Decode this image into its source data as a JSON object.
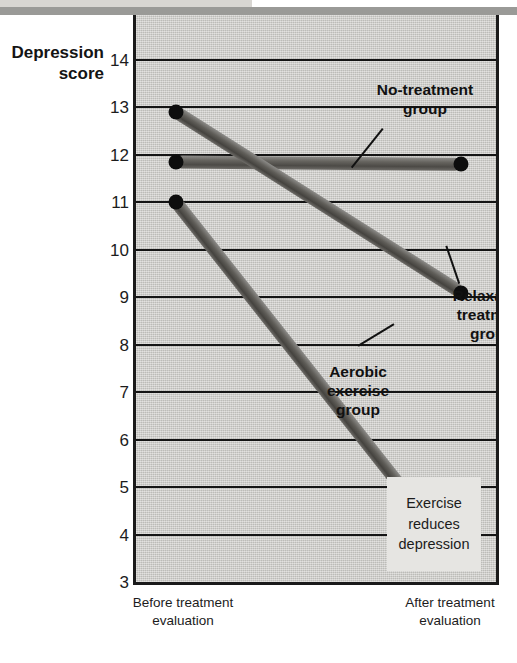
{
  "chart_data": {
    "type": "line",
    "title": "",
    "ylabel_line1": "Depression",
    "ylabel_line2": "score",
    "xlabel": "",
    "categories": [
      "Before treatment evaluation",
      "After treatment evaluation"
    ],
    "x_tick_labels": [
      {
        "line1": "Before treatment",
        "line2": "evaluation"
      },
      {
        "line1": "After treatment",
        "line2": "evaluation"
      }
    ],
    "ylim": [
      3,
      14
    ],
    "y_ticks": [
      14,
      13,
      12,
      11,
      10,
      9,
      8,
      7,
      6,
      5,
      4,
      3
    ],
    "grid": true,
    "legend_position": "inline-callouts",
    "series": [
      {
        "name": "No-treatment group",
        "values": [
          11.85,
          11.8
        ],
        "color": "#5a5853"
      },
      {
        "name": "Relaxation treatment group",
        "values": [
          12.9,
          9.1
        ],
        "color": "#4f4d48"
      },
      {
        "name": "Aerobic exercise group",
        "values": [
          11.0,
          3.4
        ],
        "color": "#4f4d48"
      }
    ],
    "annotations": [
      {
        "name": "exercise-reduces-depression",
        "lines": [
          "Exercise",
          "reduces",
          "depression"
        ]
      }
    ]
  },
  "axis": {
    "y_title_line1": "Depression",
    "y_title_line2": "score",
    "ticks": [
      "14",
      "13",
      "12",
      "11",
      "10",
      "9",
      "8",
      "7",
      "6",
      "5",
      "4",
      "3"
    ]
  },
  "x_axis": {
    "before_line1": "Before treatment",
    "before_line2": "evaluation",
    "after_line1": "After treatment",
    "after_line2": "evaluation"
  },
  "callouts": {
    "notreatment_line1": "No-treatment",
    "notreatment_line2": "group",
    "relaxation_line1": "Relaxation",
    "relaxation_line2": "treatment",
    "relaxation_line3": "group",
    "aerobic_line1": "Aerobic",
    "aerobic_line2": "exercise",
    "aerobic_line3": "group"
  },
  "annotation": {
    "line1": "Exercise",
    "line2": "reduces",
    "line3": "depression"
  },
  "colors": {
    "plot_background": "#c9c8c4",
    "annotation_background": "#e6e5e2",
    "gridline": "#141414",
    "axis": "#1a1a1a",
    "band_light": "#d8d6d2",
    "band_dark": "#9a9a97",
    "marker": "#0d0d0d"
  }
}
